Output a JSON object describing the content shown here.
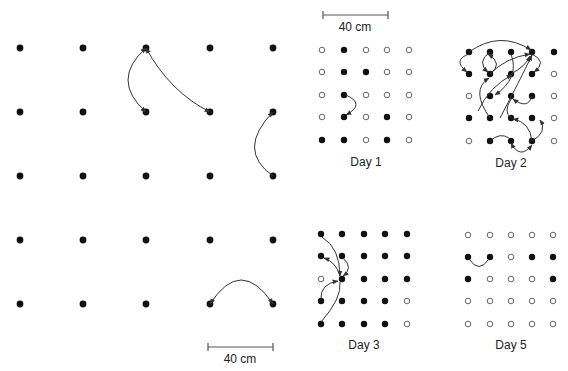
{
  "figure": {
    "left_grid": {
      "cols_x": [
        20,
        83,
        146,
        210,
        273
      ],
      "rows_y": [
        48,
        112,
        176,
        240,
        304
      ],
      "dot_radius": 3.4,
      "arrows": [
        {
          "from": [
            146,
            48
          ],
          "to": [
            146,
            112
          ],
          "ctrl": [
            110,
            80
          ],
          "heads": "both"
        },
        {
          "from": [
            146,
            48
          ],
          "to": [
            210,
            112
          ],
          "ctrl": [
            170,
            92
          ],
          "heads": "both"
        },
        {
          "from": [
            273,
            176
          ],
          "to": [
            273,
            112
          ],
          "ctrl": [
            236,
            150
          ],
          "heads": "end"
        },
        {
          "from": [
            210,
            304
          ],
          "to": [
            273,
            304
          ],
          "ctrl": [
            241,
            256
          ],
          "heads": "both"
        }
      ],
      "scale_bar": {
        "x1": 208,
        "x2": 273,
        "y": 347,
        "label": "40 cm"
      }
    },
    "panels": [
      {
        "id": "day1",
        "label": "Day 1",
        "cols_x": [
          322,
          344,
          366,
          387,
          409
        ],
        "rows_y": [
          50,
          72,
          95,
          117,
          140
        ],
        "label_y": 155,
        "filled": [
          [
            0,
            1,
            0,
            0,
            0
          ],
          [
            0,
            1,
            1,
            0,
            0
          ],
          [
            0,
            1,
            0,
            0,
            0
          ],
          [
            0,
            1,
            0,
            1,
            0
          ],
          [
            1,
            1,
            0,
            1,
            0
          ]
        ],
        "arrows": [
          {
            "from": [
              346,
              95
            ],
            "to": [
              346,
              115
            ],
            "ctrl": [
              366,
              104
            ],
            "heads": "end"
          }
        ]
      },
      {
        "id": "day2",
        "label": "Day 2",
        "cols_x": [
          469,
          490,
          511,
          532,
          554
        ],
        "rows_y": [
          52,
          74,
          96,
          118,
          141
        ],
        "label_y": 156,
        "filled": [
          [
            1,
            1,
            1,
            1,
            1
          ],
          [
            1,
            1,
            1,
            1,
            0
          ],
          [
            0,
            1,
            1,
            1,
            0
          ],
          [
            1,
            1,
            1,
            1,
            0
          ],
          [
            0,
            1,
            1,
            1,
            0
          ]
        ],
        "arrows": [
          {
            "from": [
              469,
              52
            ],
            "to": [
              531,
              50
            ],
            "ctrl": [
              500,
              30
            ],
            "heads": "end"
          },
          {
            "from": [
              469,
              54
            ],
            "to": [
              467,
              72
            ],
            "ctrl": [
              452,
              60
            ],
            "heads": "end"
          },
          {
            "from": [
              490,
              52
            ],
            "to": [
              488,
              72
            ],
            "ctrl": [
              476,
              62
            ],
            "heads": "end"
          },
          {
            "from": [
              490,
              74
            ],
            "to": [
              488,
              54
            ],
            "ctrl": [
              504,
              64
            ],
            "heads": "end"
          },
          {
            "from": [
              511,
              54
            ],
            "to": [
              495,
              95
            ],
            "ctrl": [
              520,
              78
            ],
            "heads": "end"
          },
          {
            "from": [
              532,
              54
            ],
            "to": [
              534,
              72
            ],
            "ctrl": [
              548,
              62
            ],
            "heads": "end"
          },
          {
            "from": [
              490,
              74
            ],
            "to": [
              530,
              54
            ],
            "ctrl": [
              505,
              58
            ],
            "heads": "end"
          },
          {
            "from": [
              511,
              74
            ],
            "to": [
              530,
              56
            ],
            "ctrl": [
              526,
              66
            ],
            "heads": "end"
          },
          {
            "from": [
              500,
              118
            ],
            "to": [
              532,
              55
            ],
            "ctrl": [
              520,
              80
            ],
            "heads": "end"
          },
          {
            "from": [
              478,
              111
            ],
            "to": [
              512,
              75
            ],
            "ctrl": [
              490,
              86
            ],
            "heads": "end"
          },
          {
            "from": [
              490,
              118
            ],
            "to": [
              489,
              78
            ],
            "ctrl": [
              470,
              90
            ],
            "heads": "end"
          },
          {
            "from": [
              532,
              96
            ],
            "to": [
              513,
              99
            ],
            "ctrl": [
              528,
              110
            ],
            "heads": "end"
          },
          {
            "from": [
              532,
              141
            ],
            "to": [
              513,
              119
            ],
            "ctrl": [
              530,
              122
            ],
            "heads": "end"
          },
          {
            "from": [
              511,
              99
            ],
            "to": [
              511,
              118
            ],
            "ctrl": [
              503,
              112
            ],
            "heads": "none"
          },
          {
            "from": [
              490,
              141
            ],
            "to": [
              509,
              138
            ],
            "ctrl": [
              500,
              132
            ],
            "heads": "none"
          },
          {
            "from": [
              511,
              143
            ],
            "to": [
              532,
              145
            ],
            "ctrl": [
              520,
              160
            ],
            "heads": "both"
          },
          {
            "from": [
              532,
              141
            ],
            "to": [
              540,
              120
            ],
            "ctrl": [
              548,
              132
            ],
            "heads": "end"
          }
        ]
      },
      {
        "id": "day3",
        "label": "Day 3",
        "cols_x": [
          321,
          342,
          364,
          385,
          407
        ],
        "rows_y": [
          234,
          256,
          279,
          301,
          324
        ],
        "label_y": 338,
        "filled": [
          [
            1,
            1,
            1,
            1,
            1
          ],
          [
            1,
            1,
            1,
            1,
            1
          ],
          [
            0,
            1,
            1,
            1,
            1
          ],
          [
            1,
            1,
            1,
            1,
            0
          ],
          [
            1,
            1,
            1,
            1,
            0
          ]
        ],
        "arrows": [
          {
            "from": [
              322,
              237
            ],
            "to": [
              340,
              276
            ],
            "ctrl": [
              340,
              248
            ],
            "heads": "end"
          },
          {
            "from": [
              343,
              258
            ],
            "to": [
              343,
              276
            ],
            "ctrl": [
              354,
              268
            ],
            "heads": "end"
          },
          {
            "from": [
              340,
              276
            ],
            "to": [
              324,
              258
            ],
            "ctrl": [
              336,
              262
            ],
            "heads": "end"
          },
          {
            "from": [
              321,
              299
            ],
            "to": [
              338,
              281
            ],
            "ctrl": [
              320,
              284
            ],
            "heads": "end"
          },
          {
            "from": [
              321,
              322
            ],
            "to": [
              340,
              282
            ],
            "ctrl": [
              342,
              298
            ],
            "heads": "none"
          }
        ]
      },
      {
        "id": "day5",
        "label": "Day 5",
        "cols_x": [
          468,
          490,
          511,
          532,
          553
        ],
        "rows_y": [
          235,
          257,
          279,
          301,
          324
        ],
        "label_y": 338,
        "filled": [
          [
            0,
            0,
            0,
            0,
            0
          ],
          [
            1,
            1,
            0,
            1,
            1
          ],
          [
            1,
            0,
            0,
            0,
            1
          ],
          [
            0,
            0,
            0,
            0,
            0
          ],
          [
            0,
            0,
            0,
            0,
            0
          ]
        ],
        "arrows": [
          {
            "from": [
              469,
              259
            ],
            "to": [
              489,
              259
            ],
            "ctrl": [
              479,
              274
            ],
            "heads": "none"
          }
        ]
      }
    ],
    "top_scale_bar": {
      "x1": 323,
      "x2": 388,
      "y": 15,
      "label": "40 cm"
    },
    "colors": {
      "filled_dot": "#111111",
      "hollow_stroke": "#666666",
      "arrow": "#333333",
      "text": "#222222"
    }
  }
}
